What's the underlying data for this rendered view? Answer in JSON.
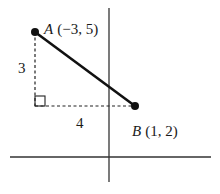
{
  "diagram": {
    "type": "coordinate-geometry",
    "points": [
      {
        "name": "A",
        "label": "A",
        "coords_text": "(−3, 5)",
        "x": -3,
        "y": 5
      },
      {
        "name": "B",
        "label": "B",
        "coords_text": "(1, 2)",
        "x": 1,
        "y": 2
      }
    ],
    "legs": {
      "vertical_label": "3",
      "horizontal_label": "4"
    },
    "colors": {
      "line": "#111111",
      "axis": "#333333",
      "dashed": "#222222"
    }
  }
}
